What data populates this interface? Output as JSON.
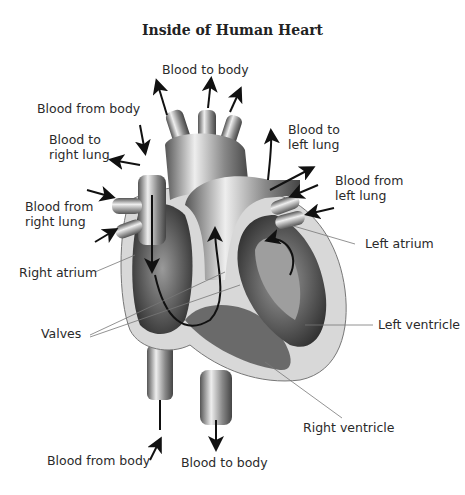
{
  "title": "Inside of Human Heart",
  "labels": {
    "blood_to_body_top": "Blood to body",
    "blood_from_body_top": "Blood from body",
    "blood_to_right_lung_1": "Blood to",
    "blood_to_right_lung_2": "right lung",
    "blood_from_right_lung_1": "Blood from",
    "blood_from_right_lung_2": "right lung",
    "blood_to_left_lung_1": "Blood to",
    "blood_to_left_lung_2": "left lung",
    "blood_from_left_lung_1": "Blood from",
    "blood_from_left_lung_2": "left lung",
    "left_atrium": "Left atrium",
    "right_atrium": "Right atrium",
    "valves": "Valves",
    "left_ventricle": "Left ventricle",
    "right_ventricle": "Right ventricle",
    "blood_from_body_bottom": "Blood from body",
    "blood_to_body_bottom": "Blood to body"
  },
  "colors": {
    "line": "#111111",
    "leader": "#777777",
    "tissue_light": "#d6d6d6",
    "tissue_mid": "#8a8a8a",
    "tissue_dark": "#3a3a3a"
  }
}
